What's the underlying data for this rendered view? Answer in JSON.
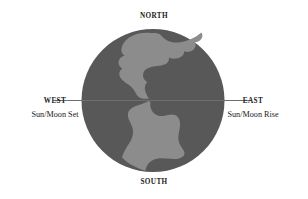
{
  "diagram": {
    "title_semantic": "earth-horizon-cardinal-directions",
    "labels": {
      "north": "NORTH",
      "south": "SOUTH",
      "west": "WEST",
      "east": "EAST",
      "west_event": "Sun/Moon Set",
      "east_event": "Sun/Moon Rise"
    },
    "colors": {
      "background": "#ffffff",
      "ocean": "#585858",
      "land": "#8c8c8c",
      "horizon_line": "#6e6e6e",
      "text": "#1a1a1a"
    },
    "globe": {
      "center_x": 153,
      "center_y": 100,
      "radius": 71
    },
    "horizon": {
      "y": 100,
      "x_start": 55,
      "x_end": 251
    }
  }
}
